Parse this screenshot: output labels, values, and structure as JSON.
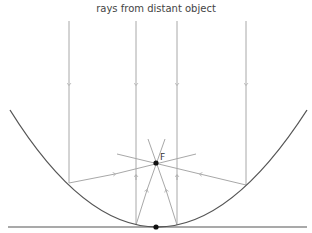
{
  "diagram": {
    "title": "rays from distant object",
    "focus_label": "F",
    "colors": {
      "ray": "#a8a8a8",
      "mirror": "#555555",
      "point": "#111111",
      "axis": "#555555"
    },
    "focus": [
      156,
      163
    ],
    "vertex": [
      156,
      227
    ],
    "incoming_ray_x": [
      69,
      136,
      177,
      246
    ]
  }
}
